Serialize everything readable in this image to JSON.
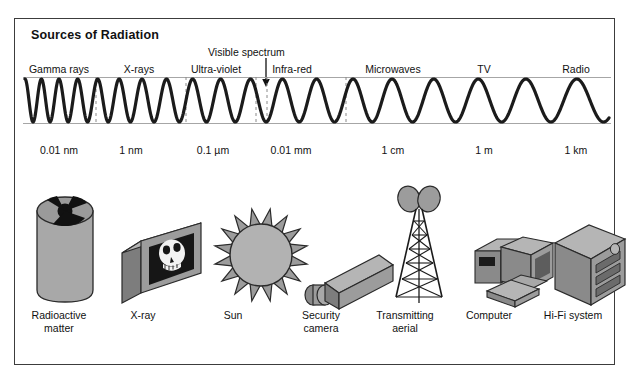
{
  "figure": {
    "title": "Sources of Radiation",
    "background_color": "#ffffff",
    "border_color": "#3c3c3c",
    "ink_color": "#111111",
    "fill_light": "#a8a8a8",
    "fill_mid": "#8e8e8e",
    "fill_dark": "#6f6f6f"
  },
  "annotation": {
    "visible_spectrum_label": "Visible spectrum",
    "arrow_icon": "down-arrow-icon"
  },
  "chart_data": {
    "type": "line",
    "title": "Sources of Radiation",
    "xlabel": "",
    "ylabel": "",
    "grid": false,
    "legend": "none",
    "bands": [
      {
        "name": "Gamma rays",
        "label_x": 58,
        "wavelength": "0.01 nm",
        "wavelength_x": 58,
        "source": "Radioactive matter",
        "source_x": 58
      },
      {
        "name": "X-rays",
        "label_x": 138,
        "wavelength": "1 nm",
        "wavelength_x": 130,
        "source": "X-ray",
        "source_x": 142
      },
      {
        "name": "Ultra-violet",
        "label_x": 215,
        "wavelength": "0.1 µm",
        "wavelength_x": 212,
        "source": "Sun",
        "source_x": 232
      },
      {
        "name": "Infra-red",
        "label_x": 290,
        "wavelength": "0.01 mm",
        "wavelength_x": 290,
        "source": "Security camera",
        "source_x": 320
      },
      {
        "name": "Microwaves",
        "label_x": 392,
        "wavelength": "1 cm",
        "wavelength_x": 392,
        "source": "Transmitting aerial",
        "source_x": 404
      },
      {
        "name": "TV",
        "label_x": 483,
        "wavelength": "1 m",
        "wavelength_x": 483,
        "source": "Computer",
        "source_x": 488
      },
      {
        "name": "Radio",
        "label_x": 575,
        "wavelength": "1 km",
        "wavelength_x": 575,
        "source": "Hi-Fi system",
        "source_x": 572
      }
    ],
    "band_divider_x": [
      95,
      185,
      255,
      345
    ],
    "visible_spectrum_marker_x": 265,
    "wave_axis": {
      "x_start": 22,
      "x_end": 610,
      "baseline_y": 122,
      "crest_y": 78,
      "amplitude": 22
    },
    "wavelength_scale_note": "wavelength grows smoothly left to right (log scale from 0.01 nm to 1 km)"
  },
  "sources": [
    {
      "id": "radioactive-matter",
      "label_line1": "Radioactive",
      "label_line2": "matter",
      "icon": "radiation-drum-icon"
    },
    {
      "id": "x-ray",
      "label_line1": "X-ray",
      "label_line2": "",
      "icon": "xray-skull-icon"
    },
    {
      "id": "sun",
      "label_line1": "Sun",
      "label_line2": "",
      "icon": "sun-icon"
    },
    {
      "id": "security-camera",
      "label_line1": "Security",
      "label_line2": "camera",
      "icon": "security-camera-icon"
    },
    {
      "id": "transmitting-aerial",
      "label_line1": "Transmitting",
      "label_line2": "aerial",
      "icon": "transmitter-mast-icon"
    },
    {
      "id": "computer",
      "label_line1": "Computer",
      "label_line2": "",
      "icon": "desktop-computer-icon"
    },
    {
      "id": "hifi-system",
      "label_line1": "Hi-Fi system",
      "label_line2": "",
      "icon": "hifi-stack-icon"
    }
  ]
}
